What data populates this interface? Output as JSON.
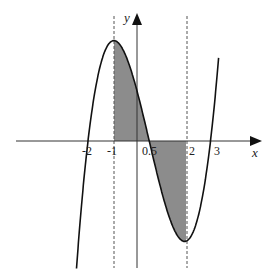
{
  "figure": {
    "axis_labels": {
      "x": "x",
      "y": "y"
    },
    "tick_labels": [
      {
        "value": -2,
        "label": "-2"
      },
      {
        "value": -1,
        "label": "-1"
      },
      {
        "value": 0.5,
        "label": "0.5"
      },
      {
        "value": 2,
        "label": "2"
      },
      {
        "value": 3,
        "label": "3"
      }
    ],
    "curve": {
      "description": "cubic through roots -2, 0.5, 3 with local max at x=-1 and local min at x=2",
      "roots": [
        -2,
        0.5,
        3
      ],
      "local_max_x": -1,
      "local_min_x": 2
    },
    "dashed_lines_x": [
      -1,
      2
    ],
    "shaded_regions": [
      {
        "from": -1,
        "to": 0.5,
        "side": "above x-axis"
      },
      {
        "from": 0.5,
        "to": 2,
        "side": "below x-axis"
      }
    ],
    "colors": {
      "curve": "#111111",
      "shade": "#8c8c8c",
      "axis": "#333333"
    }
  }
}
